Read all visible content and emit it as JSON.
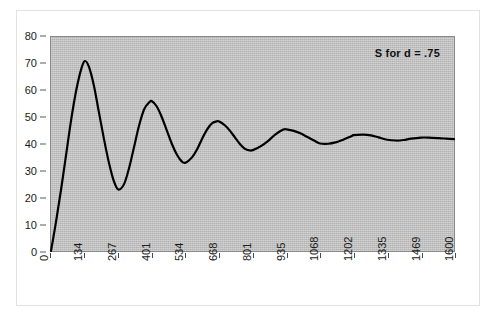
{
  "chart_data": {
    "type": "line",
    "title": "",
    "subtitle": "",
    "xlabel": "",
    "ylabel": "",
    "annotation": "S for d = .75",
    "grid": false,
    "legend": "none",
    "xlim": [
      0,
      1600
    ],
    "ylim": [
      0,
      80
    ],
    "ytick_labels": [
      "80",
      "70",
      "60",
      "50",
      "40",
      "30",
      "20",
      "10",
      "0"
    ],
    "ytick_values": [
      80,
      70,
      60,
      50,
      40,
      30,
      20,
      10,
      0
    ],
    "xtick_labels": [
      "0",
      "134",
      "267",
      "401",
      "534",
      "668",
      "801",
      "935",
      "1068",
      "1202",
      "1335",
      "1469",
      "1600"
    ],
    "xtick_values": [
      0,
      134,
      267,
      401,
      534,
      668,
      801,
      935,
      1068,
      1202,
      1335,
      1469,
      1600
    ],
    "series": [
      {
        "name": "S for d = .75",
        "color": "#000000",
        "x": [
          0,
          20,
          40,
          60,
          80,
          100,
          120,
          134,
          150,
          170,
          190,
          210,
          230,
          250,
          267,
          290,
          310,
          330,
          350,
          370,
          390,
          401,
          420,
          440,
          460,
          480,
          500,
          520,
          534,
          560,
          580,
          600,
          620,
          640,
          660,
          668,
          690,
          710,
          730,
          750,
          770,
          790,
          801,
          830,
          860,
          890,
          920,
          935,
          960,
          990,
          1020,
          1050,
          1068,
          1100,
          1130,
          1160,
          1190,
          1202,
          1240,
          1270,
          1300,
          1335,
          1370,
          1400,
          1430,
          1469,
          1500,
          1540,
          1570,
          1600
        ],
        "y": [
          0,
          11,
          23,
          36,
          49,
          60,
          68,
          71,
          69,
          62,
          52,
          42,
          33,
          26,
          23,
          25,
          31,
          39,
          47,
          53,
          55.6,
          56,
          54,
          50,
          45,
          40,
          36,
          33.4,
          33,
          35,
          38,
          42,
          45.5,
          47.8,
          48.5,
          48.4,
          47,
          45,
          42.5,
          40,
          38.2,
          37.6,
          37.7,
          39,
          41,
          43.5,
          45.3,
          45.5,
          45,
          44,
          42.5,
          41,
          40.2,
          40.1,
          40.6,
          41.6,
          42.8,
          43.3,
          43.5,
          43.2,
          42.5,
          41.6,
          41.3,
          41.5,
          42,
          42.4,
          42.4,
          42.2,
          42,
          41.8
        ]
      }
    ]
  },
  "chart_meta": {
    "plot_background_color": "#c3c3c3",
    "line_color": "#000000",
    "axis_color": "#4a4a4a",
    "page_background_color": "#ffffff"
  }
}
